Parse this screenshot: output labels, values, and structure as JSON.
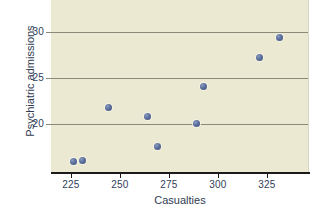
{
  "chart_data": {
    "type": "scatter",
    "title": "",
    "xlabel": "Casualties",
    "ylabel": "Psychiatric admissions",
    "xlim": [
      212,
      343
    ],
    "ylim": [
      15.8,
      34.5
    ],
    "xticks": [
      225,
      250,
      275,
      300,
      325
    ],
    "yticks": [
      20,
      25,
      30
    ],
    "grid": "horizontal",
    "legend": "none",
    "marker_color": "#4f6494",
    "panel_color": "#ece9d2",
    "points": [
      {
        "x": 223.5,
        "y": 16.9
      },
      {
        "x": 228.0,
        "y": 17.1
      },
      {
        "x": 241.3,
        "y": 22.8
      },
      {
        "x": 261.2,
        "y": 21.8
      },
      {
        "x": 266.3,
        "y": 18.6
      },
      {
        "x": 285.7,
        "y": 21.1
      },
      {
        "x": 289.3,
        "y": 25.1
      },
      {
        "x": 317.9,
        "y": 28.3
      },
      {
        "x": 328.2,
        "y": 30.4
      }
    ]
  },
  "axes": {
    "x_title": "Casualties",
    "y_title": "Psychiatric admissions",
    "x_tick_labels": [
      "225",
      "250",
      "275",
      "300",
      "325"
    ],
    "y_tick_labels": [
      "30",
      "25",
      "20"
    ]
  }
}
